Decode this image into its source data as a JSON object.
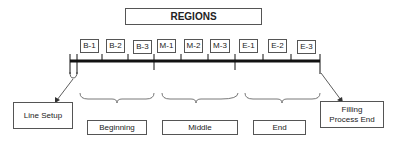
{
  "title": "REGIONS",
  "segments": [
    "B-1",
    "B-2",
    "B-3",
    "M-1",
    "M-2",
    "M-3",
    "E-1",
    "E-2",
    "E-3"
  ],
  "phases": [
    "Beginning",
    "Middle",
    "End"
  ],
  "start_label": "Line Setup",
  "end_label_1": "Filling",
  "end_label_2": "Process End"
}
